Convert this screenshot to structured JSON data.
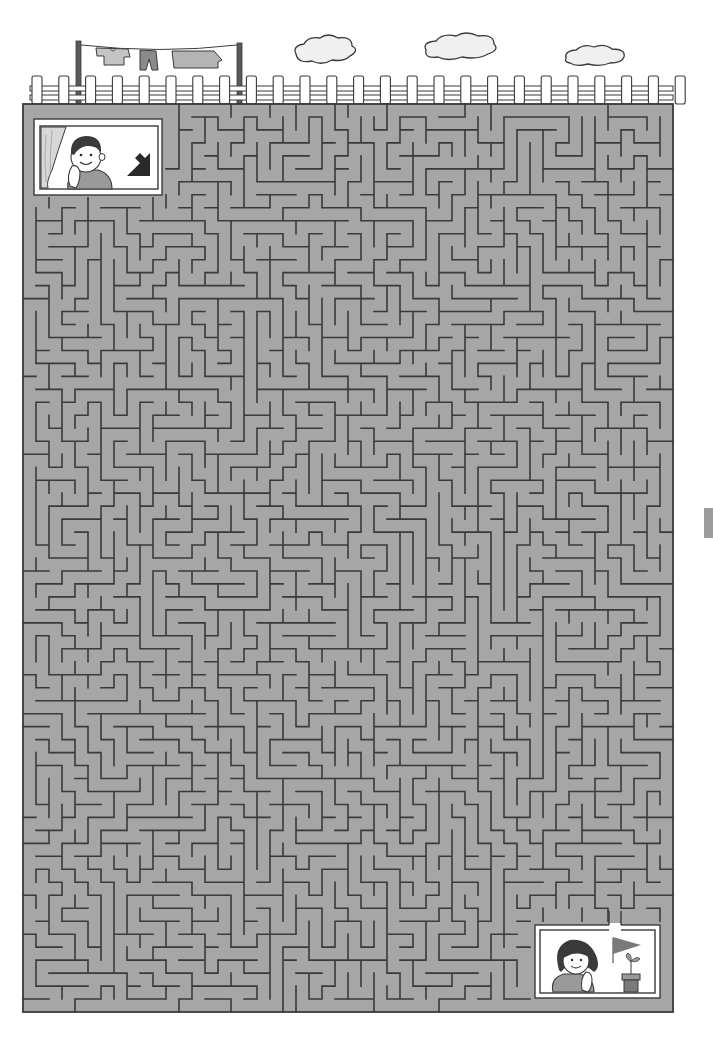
{
  "puzzle": {
    "type": "maze",
    "title": "Rooftop maze",
    "start": {
      "label": "Start",
      "character": "boy-at-window",
      "hint_icon": "arrow-down-right"
    },
    "goal": {
      "label": "Goal",
      "character": "girl-at-window",
      "props": [
        "flag",
        "potted-sprout"
      ]
    },
    "scenery": [
      "clothesline-with-laundry",
      "white-picket-fence",
      "clouds"
    ],
    "grid": {
      "columns": 50,
      "rows": 70
    }
  },
  "colors": {
    "maze_floor": "#a6a6a6",
    "wall": "#3a3a3a",
    "window_frame": "#ffffff",
    "fence": "#ffffff",
    "cloud": "#f0f0f0",
    "laundry": "#b0b0b0",
    "arrow": "#2a2a2a",
    "flag": "#7a7a7a"
  }
}
